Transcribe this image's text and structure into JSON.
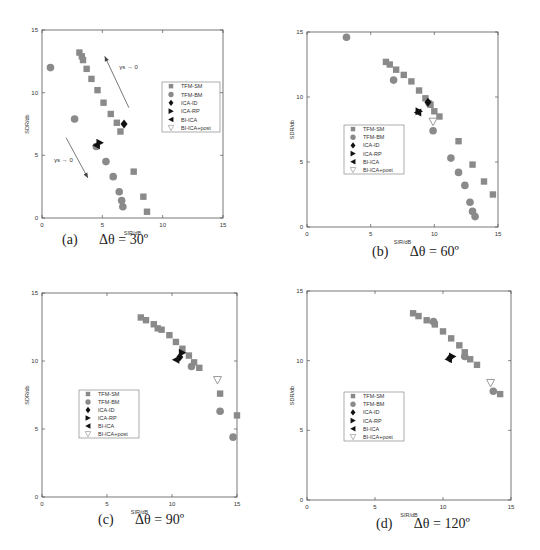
{
  "figure": {
    "legend_labels": [
      "TFM-SM",
      "TFM-BM",
      "ICA-ID",
      "ICA-RP",
      "BI-ICA",
      "BI-ICA+post"
    ],
    "colors": {
      "tfm": "#8a8a8a",
      "ica": "#111111",
      "post": "#9a9a9a",
      "axis": "#555555",
      "text": "#333333"
    }
  },
  "chart_data": [
    {
      "type": "scatter",
      "panel": "a",
      "caption_label": "(a)",
      "caption_text": "Δθ = 30º",
      "xlabel": "SIR/dB",
      "ylabel": "SDR/db",
      "xlim": [
        0,
        15
      ],
      "ylim": [
        0,
        15
      ],
      "xticks": [
        0,
        5,
        10,
        15
      ],
      "yticks": [
        0,
        5,
        10,
        15
      ],
      "grid": false,
      "legend_position": "upper right",
      "annotations": [
        {
          "text": "γs → 0",
          "x": 6.4,
          "y": 11.9,
          "arrow_from": [
            7.2,
            8.8
          ],
          "arrow_to": [
            5.2,
            12.9
          ]
        },
        {
          "text": "γs → 0",
          "x": 1.0,
          "y": 4.5,
          "arrow_from": [
            2.0,
            6.4
          ],
          "arrow_to": [
            3.8,
            3.2
          ]
        }
      ],
      "series": [
        {
          "name": "TFM-SM",
          "marker": "square",
          "points": [
            [
              3.1,
              13.2
            ],
            [
              3.3,
              12.9
            ],
            [
              3.4,
              12.6
            ],
            [
              3.7,
              11.9
            ],
            [
              4.1,
              11.1
            ],
            [
              4.6,
              10.2
            ],
            [
              5.1,
              9.2
            ],
            [
              5.7,
              8.3
            ],
            [
              6.2,
              7.6
            ],
            [
              6.5,
              6.9
            ],
            [
              7.6,
              3.7
            ],
            [
              8.4,
              1.7
            ],
            [
              8.7,
              0.5
            ]
          ]
        },
        {
          "name": "TFM-BM",
          "marker": "circle",
          "points": [
            [
              0.7,
              12.0
            ],
            [
              2.7,
              7.9
            ],
            [
              4.5,
              5.7
            ],
            [
              5.3,
              4.5
            ],
            [
              5.9,
              3.3
            ],
            [
              6.4,
              2.1
            ],
            [
              6.6,
              1.4
            ],
            [
              6.7,
              0.9
            ]
          ]
        },
        {
          "name": "ICA-ID",
          "marker": "diamond",
          "points": [
            [
              6.8,
              7.5
            ]
          ]
        },
        {
          "name": "ICA-RP",
          "marker": "triangle-right",
          "points": [
            [
              4.8,
              6.0
            ]
          ]
        },
        {
          "name": "BI-ICA",
          "marker": "triangle-left",
          "points": [
            [
              4.5,
              5.8
            ]
          ]
        },
        {
          "name": "BI-ICA+post",
          "marker": "triangle-down",
          "points": []
        }
      ]
    },
    {
      "type": "scatter",
      "panel": "b",
      "caption_label": "(b)",
      "caption_text": "Δθ = 60º",
      "xlabel": "SIR/dB",
      "ylabel": "SDR/db",
      "xlim": [
        0,
        15
      ],
      "ylim": [
        0,
        15
      ],
      "xticks": [
        0,
        5,
        10,
        15
      ],
      "yticks": [
        0,
        5,
        10,
        15
      ],
      "grid": false,
      "legend_position": "center left",
      "annotations": [],
      "series": [
        {
          "name": "TFM-SM",
          "marker": "square",
          "points": [
            [
              6.2,
              12.7
            ],
            [
              6.5,
              12.5
            ],
            [
              7.0,
              12.1
            ],
            [
              7.6,
              11.7
            ],
            [
              8.2,
              11.2
            ],
            [
              8.8,
              10.5
            ],
            [
              9.3,
              9.9
            ],
            [
              9.7,
              9.4
            ],
            [
              10.0,
              8.9
            ],
            [
              10.4,
              8.5
            ],
            [
              11.9,
              6.6
            ],
            [
              13.0,
              4.8
            ],
            [
              13.9,
              3.5
            ],
            [
              14.6,
              2.5
            ]
          ]
        },
        {
          "name": "TFM-BM",
          "marker": "circle",
          "points": [
            [
              3.1,
              14.6
            ],
            [
              6.8,
              11.3
            ],
            [
              9.6,
              9.5
            ],
            [
              9.9,
              7.4
            ],
            [
              11.3,
              5.3
            ],
            [
              11.9,
              4.2
            ],
            [
              12.4,
              3.2
            ],
            [
              12.8,
              1.9
            ],
            [
              13.0,
              1.2
            ],
            [
              13.2,
              0.8
            ]
          ]
        },
        {
          "name": "ICA-ID",
          "marker": "diamond",
          "points": [
            [
              9.5,
              9.6
            ]
          ]
        },
        {
          "name": "ICA-RP",
          "marker": "triangle-right",
          "points": [
            [
              8.8,
              8.9
            ]
          ]
        },
        {
          "name": "BI-ICA",
          "marker": "triangle-left",
          "points": [
            [
              8.7,
              8.8
            ]
          ]
        },
        {
          "name": "BI-ICA+post",
          "marker": "triangle-down",
          "points": [
            [
              9.9,
              8.1
            ]
          ]
        }
      ]
    },
    {
      "type": "scatter",
      "panel": "c",
      "caption_label": "(c)",
      "caption_text": "Δθ = 90º",
      "xlabel": "SIR/dB",
      "ylabel": "SDR/db",
      "xlim": [
        0,
        15
      ],
      "ylim": [
        0,
        15
      ],
      "xticks": [
        0,
        5,
        10,
        15
      ],
      "yticks": [
        0,
        5,
        10,
        15
      ],
      "grid": false,
      "legend_position": "center left",
      "annotations": [],
      "series": [
        {
          "name": "TFM-SM",
          "marker": "square",
          "points": [
            [
              7.6,
              13.2
            ],
            [
              8.0,
              13.0
            ],
            [
              8.6,
              12.7
            ],
            [
              8.9,
              12.4
            ],
            [
              9.2,
              12.3
            ],
            [
              9.8,
              11.9
            ],
            [
              10.3,
              11.4
            ],
            [
              10.8,
              10.9
            ],
            [
              11.3,
              10.4
            ],
            [
              11.7,
              9.9
            ],
            [
              12.1,
              9.5
            ],
            [
              13.7,
              7.6
            ],
            [
              15.0,
              6.0
            ]
          ]
        },
        {
          "name": "TFM-BM",
          "marker": "circle",
          "points": [
            [
              11.5,
              9.6
            ],
            [
              13.7,
              6.3
            ],
            [
              14.7,
              4.4
            ]
          ]
        },
        {
          "name": "ICA-ID",
          "marker": "diamond",
          "points": [
            [
              10.6,
              10.3
            ]
          ]
        },
        {
          "name": "ICA-RP",
          "marker": "triangle-right",
          "points": [
            [
              10.8,
              10.6
            ]
          ]
        },
        {
          "name": "BI-ICA",
          "marker": "triangle-left",
          "points": [
            [
              10.3,
              10.1
            ]
          ]
        },
        {
          "name": "BI-ICA+post",
          "marker": "triangle-down",
          "points": [
            [
              13.5,
              8.6
            ]
          ]
        }
      ]
    },
    {
      "type": "scatter",
      "panel": "d",
      "caption_label": "(d)",
      "caption_text": "Δθ = 120º",
      "xlabel": "SIR/dB",
      "ylabel": "SDR/db",
      "xlim": [
        0,
        15
      ],
      "ylim": [
        0,
        15
      ],
      "xticks": [
        0,
        5,
        10,
        15
      ],
      "yticks": [
        0,
        5,
        10,
        15
      ],
      "grid": false,
      "legend_position": "center left",
      "annotations": [],
      "series": [
        {
          "name": "TFM-SM",
          "marker": "square",
          "points": [
            [
              7.8,
              13.4
            ],
            [
              8.2,
              13.2
            ],
            [
              8.8,
              12.9
            ],
            [
              9.4,
              12.6
            ],
            [
              10.0,
              12.1
            ],
            [
              10.6,
              11.6
            ],
            [
              11.2,
              11.1
            ],
            [
              11.6,
              10.6
            ],
            [
              12.0,
              10.1
            ],
            [
              12.5,
              9.7
            ],
            [
              14.2,
              7.6
            ]
          ]
        },
        {
          "name": "TFM-BM",
          "marker": "circle",
          "points": [
            [
              9.3,
              12.8
            ],
            [
              11.6,
              10.3
            ],
            [
              13.7,
              7.8
            ]
          ]
        },
        {
          "name": "ICA-ID",
          "marker": "diamond",
          "points": [
            [
              10.5,
              10.2
            ]
          ]
        },
        {
          "name": "ICA-RP",
          "marker": "triangle-right",
          "points": [
            [
              10.7,
              10.3
            ]
          ]
        },
        {
          "name": "BI-ICA",
          "marker": "triangle-left",
          "points": [
            [
              10.4,
              10.1
            ]
          ]
        },
        {
          "name": "BI-ICA+post",
          "marker": "triangle-down",
          "points": [
            [
              13.5,
              8.4
            ]
          ]
        }
      ]
    }
  ],
  "layout": {
    "panels": [
      {
        "id": "a",
        "x0": 42,
        "x1": 223,
        "y0": 30,
        "y1": 218,
        "legend": {
          "x": 162,
          "y": 82,
          "w": 58,
          "h": 50
        },
        "caption": {
          "x": 62,
          "y": 233
        }
      },
      {
        "id": "b",
        "x0": 307,
        "x1": 498,
        "y0": 32,
        "y1": 227,
        "legend": {
          "x": 344,
          "y": 125,
          "w": 60,
          "h": 49
        },
        "caption": {
          "x": 372,
          "y": 245
        }
      },
      {
        "id": "c",
        "x0": 42,
        "x1": 237,
        "y0": 293,
        "y1": 497,
        "legend": {
          "x": 79,
          "y": 390,
          "w": 60,
          "h": 48
        },
        "caption": {
          "x": 98,
          "y": 513
        }
      },
      {
        "id": "d",
        "x0": 307,
        "x1": 511,
        "y0": 291,
        "y1": 500,
        "legend": {
          "x": 344,
          "y": 392,
          "w": 60,
          "h": 49
        },
        "caption": {
          "x": 376,
          "y": 517
        }
      }
    ]
  }
}
